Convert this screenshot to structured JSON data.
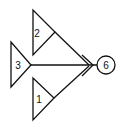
{
  "diagram": {
    "type": "network-merge",
    "stroke_color": "#111111",
    "background": "#ffffff",
    "nodes": [
      {
        "id": "node-2",
        "shape": "triangle",
        "label": "2"
      },
      {
        "id": "node-3",
        "shape": "triangle",
        "label": "3"
      },
      {
        "id": "node-1",
        "shape": "triangle",
        "label": "1"
      },
      {
        "id": "node-6",
        "shape": "circle",
        "label": "6"
      }
    ],
    "edges": [
      {
        "from": "2",
        "to": "6"
      },
      {
        "from": "3",
        "to": "6"
      },
      {
        "from": "1",
        "to": "6"
      }
    ],
    "labels": {
      "t2": "2",
      "t3": "3",
      "t1": "1",
      "c6": "6"
    }
  }
}
